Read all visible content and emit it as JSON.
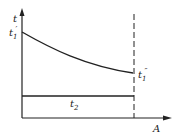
{
  "diagram": {
    "type": "temperature-area profile",
    "axes": {
      "y_label": "t",
      "x_label": "A"
    },
    "curves": [
      {
        "name": "hot fluid temperature",
        "start_label": "t₁′",
        "end_label": "t₁″",
        "shape": "decreasing convex curve"
      },
      {
        "name": "cold fluid temperature",
        "label": "t₂",
        "shape": "constant horizontal line"
      }
    ],
    "markers": [
      {
        "name": "end-of-area dashed line",
        "style": "dashed vertical"
      }
    ],
    "colors": {
      "line": "#222222",
      "background": "#ffffff"
    }
  },
  "labels": {
    "y_axis": "t",
    "x_axis": "A",
    "t1_prime_base": "t",
    "t1_prime_sub": "1",
    "t1_prime_sup": "′",
    "t1_dprime_base": "t",
    "t1_dprime_sub": "1",
    "t1_dprime_sup": "″",
    "t2_base": "t",
    "t2_sub": "2"
  }
}
